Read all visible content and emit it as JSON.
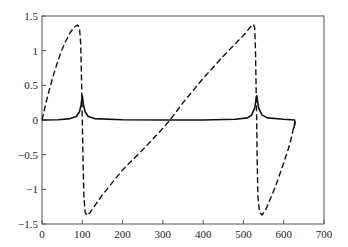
{
  "chart_data": {
    "type": "line",
    "title": "",
    "xlabel": "",
    "ylabel": "",
    "xlim": [
      0,
      700
    ],
    "ylim": [
      -1.5,
      1.5
    ],
    "grid": false,
    "legend": null,
    "x_ticks": [
      0,
      100,
      200,
      300,
      400,
      500,
      600,
      700
    ],
    "x_tick_labels": [
      "0",
      "100",
      "200",
      "300",
      "400",
      "500",
      "600",
      "700"
    ],
    "y_ticks": [
      1.5,
      1,
      0.5,
      0,
      -0.5,
      -1,
      -1.5
    ],
    "y_tick_labels": [
      "1.5",
      "1",
      "0.5",
      "0",
      "−0.5",
      "−1",
      "−1.5"
    ],
    "series": [
      {
        "name": "dashed",
        "style": "dashed",
        "color": "#111111",
        "points": [
          [
            0,
            0
          ],
          [
            10,
            0.25
          ],
          [
            20,
            0.48
          ],
          [
            30,
            0.68
          ],
          [
            40,
            0.86
          ],
          [
            50,
            1.02
          ],
          [
            60,
            1.15
          ],
          [
            70,
            1.26
          ],
          [
            80,
            1.34
          ],
          [
            88,
            1.37
          ],
          [
            93,
            1.33
          ],
          [
            96,
            1.1
          ],
          [
            98,
            0.6
          ],
          [
            100,
            0
          ],
          [
            102,
            -0.6
          ],
          [
            104,
            -1.1
          ],
          [
            107,
            -1.33
          ],
          [
            112,
            -1.38
          ],
          [
            120,
            -1.33
          ],
          [
            150,
            -1.08
          ],
          [
            200,
            -0.72
          ],
          [
            250,
            -0.43
          ],
          [
            300,
            -0.12
          ],
          [
            318,
            0
          ],
          [
            350,
            0.25
          ],
          [
            400,
            0.6
          ],
          [
            450,
            0.92
          ],
          [
            500,
            1.22
          ],
          [
            520,
            1.36
          ],
          [
            525,
            1.38
          ],
          [
            528,
            1.33
          ],
          [
            530,
            1.0
          ],
          [
            532,
            0.3
          ],
          [
            533,
            0
          ],
          [
            534,
            -0.5
          ],
          [
            536,
            -1.1
          ],
          [
            540,
            -1.33
          ],
          [
            546,
            -1.37
          ],
          [
            555,
            -1.3
          ],
          [
            580,
            -0.95
          ],
          [
            600,
            -0.62
          ],
          [
            615,
            -0.35
          ],
          [
            628,
            -0.02
          ]
        ]
      },
      {
        "name": "solid",
        "style": "solid",
        "color": "#111111",
        "points": [
          [
            0,
            0
          ],
          [
            40,
            0.005
          ],
          [
            70,
            0.02
          ],
          [
            85,
            0.05
          ],
          [
            93,
            0.12
          ],
          [
            97,
            0.22
          ],
          [
            100,
            0.35
          ],
          [
            103,
            0.22
          ],
          [
            107,
            0.12
          ],
          [
            115,
            0.05
          ],
          [
            130,
            0.02
          ],
          [
            200,
            0.005
          ],
          [
            300,
            0
          ],
          [
            400,
            0
          ],
          [
            480,
            0.01
          ],
          [
            510,
            0.03
          ],
          [
            520,
            0.07
          ],
          [
            528,
            0.17
          ],
          [
            533,
            0.35
          ],
          [
            538,
            0.17
          ],
          [
            546,
            0.07
          ],
          [
            560,
            0.03
          ],
          [
            600,
            0.01
          ],
          [
            627,
            0.0
          ],
          [
            628,
            -0.05
          ],
          [
            625,
            -0.12
          ]
        ]
      }
    ]
  }
}
